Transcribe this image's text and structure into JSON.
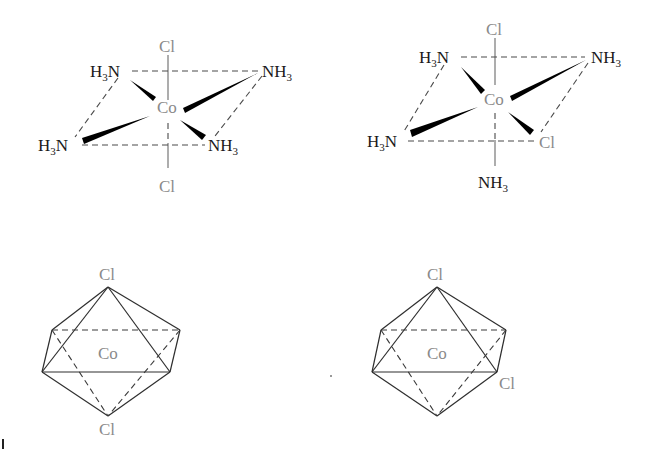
{
  "figure": {
    "colors": {
      "ligand_text": "#1a1a1a",
      "metal_and_chlorine_text": "#8a8a8a",
      "bonds": "#000000"
    }
  },
  "trans_structure": {
    "metal": "Co",
    "axial_top": "Cl",
    "axial_bottom": "Cl",
    "eq_back_left": {
      "main": "H",
      "sub": "3",
      "tail": "N"
    },
    "eq_back_right": {
      "main": "NH",
      "sub": "3"
    },
    "eq_front_left": {
      "main": "H",
      "sub": "3",
      "tail": "N"
    },
    "eq_front_right": {
      "main": "NH",
      "sub": "3"
    }
  },
  "cis_structure": {
    "metal": "Co",
    "axial_top": "Cl",
    "axial_bottom": {
      "main": "NH",
      "sub": "3"
    },
    "eq_back_left": {
      "main": "H",
      "sub": "3",
      "tail": "N"
    },
    "eq_back_right": {
      "main": "NH",
      "sub": "3"
    },
    "eq_front_left": {
      "main": "H",
      "sub": "3",
      "tail": "N"
    },
    "eq_front_right": "Cl"
  },
  "trans_octahedron": {
    "center": "Co",
    "top": "Cl",
    "bottom": "Cl"
  },
  "cis_octahedron": {
    "center": "Co",
    "top": "Cl",
    "front_right": "Cl"
  }
}
